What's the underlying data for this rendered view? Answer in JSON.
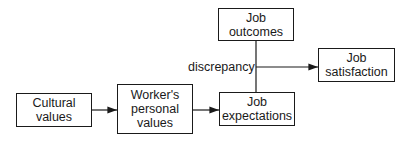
{
  "diagram": {
    "nodes": [
      {
        "id": "cultural_values",
        "label": "Cultural values",
        "lines": [
          "Cultural",
          "values"
        ]
      },
      {
        "id": "workers_personal_values",
        "label": "Worker's personal values",
        "lines": [
          "Worker's",
          "personal",
          "values"
        ]
      },
      {
        "id": "job_expectations",
        "label": "Job expectations",
        "lines": [
          "Job",
          "expectations"
        ]
      },
      {
        "id": "job_outcomes",
        "label": "Job outcomes",
        "lines": [
          "Job",
          "outcomes"
        ]
      },
      {
        "id": "job_satisfaction",
        "label": "Job satisfaction",
        "lines": [
          "Job",
          "satisfaction"
        ]
      }
    ],
    "edges": [
      {
        "from": "cultural_values",
        "to": "workers_personal_values",
        "type": "arrow"
      },
      {
        "from": "workers_personal_values",
        "to": "job_expectations",
        "type": "arrow"
      },
      {
        "from": "job_outcomes",
        "to": "job_expectations",
        "type": "line"
      },
      {
        "from": "discrepancy",
        "to": "job_satisfaction",
        "type": "arrow"
      }
    ],
    "annotation": {
      "label": "discrepancy"
    },
    "colors": {
      "stroke": "#1a1a1a",
      "background": "#ffffff"
    }
  }
}
